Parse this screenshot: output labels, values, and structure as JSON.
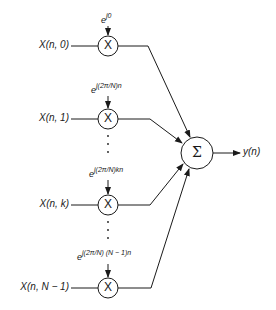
{
  "diagram": {
    "title": "",
    "type": "signal-flow / filter bank summation",
    "inputs": [
      {
        "label": "X(n, 0)",
        "exp_base": "e",
        "exp_power": "j0"
      },
      {
        "label": "X(n, 1)",
        "exp_base": "e",
        "exp_power": "j(2π/N)n"
      },
      {
        "label": "X(n, k)",
        "exp_base": "e",
        "exp_power": "j(2π/N)kn"
      },
      {
        "label": "X(n, N − 1)",
        "exp_base": "e",
        "exp_power": "j(2π/N) (N − 1)n"
      }
    ],
    "multiplier_symbol": "X",
    "sum_symbol": "Σ",
    "output_label": "y(n)",
    "ellipsis": "⋮",
    "stroke_color": "#1a1a1a",
    "background": "#ffffff"
  }
}
